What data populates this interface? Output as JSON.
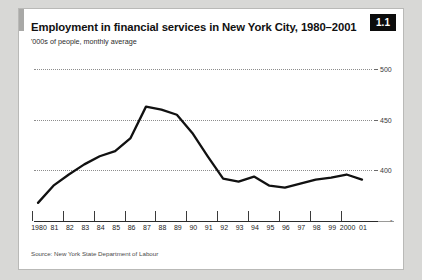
{
  "figure": {
    "badge": "1.1",
    "title": "Employment in financial services in New York City, 1980–2001",
    "subtitle": "'000s of people, monthly average",
    "source": "Source: New York State Department of Labour",
    "axis_arrow_glyph": "•"
  },
  "chart_data": {
    "type": "line",
    "title": "Employment in financial services in New York City, 1980–2001",
    "subtitle": "'000s of people, monthly average",
    "xlabel": "",
    "ylabel": "'000s of people, monthly average",
    "ylim": [
      360,
      510
    ],
    "yticks": [
      400,
      450,
      500
    ],
    "ytick_labels": [
      "400",
      "450",
      "500"
    ],
    "grid": true,
    "grid_style": "dotted",
    "legend": "none",
    "y_axis_position": "right",
    "x": [
      1980,
      1981,
      1982,
      1983,
      1984,
      1985,
      1986,
      1987,
      1988,
      1989,
      1990,
      1991,
      1992,
      1993,
      1994,
      1995,
      1996,
      1997,
      1998,
      1999,
      2000,
      2001
    ],
    "categories": [
      "1980",
      "81",
      "82",
      "83",
      "84",
      "85",
      "86",
      "87",
      "88",
      "89",
      "90",
      "91",
      "92",
      "93",
      "94",
      "95",
      "96",
      "97",
      "98",
      "99",
      "2000",
      "01"
    ],
    "series": [
      {
        "name": "Employment in financial services",
        "color": "#111111",
        "values": [
          368,
          385,
          396,
          406,
          414,
          419,
          432,
          463,
          460,
          455,
          437,
          414,
          392,
          389,
          394,
          385,
          383,
          387,
          391,
          393,
          396,
          391
        ]
      }
    ],
    "annotations": [
      {
        "text": "peak",
        "x": 1987,
        "y": 463
      },
      {
        "text": "trough",
        "x": 1996,
        "y": 383
      }
    ]
  }
}
